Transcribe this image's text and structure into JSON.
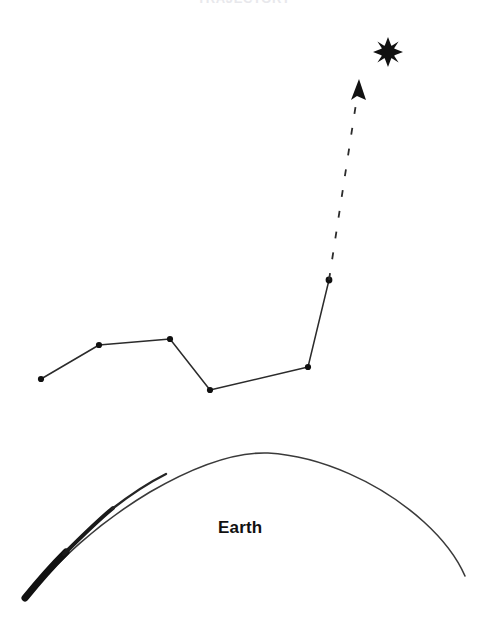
{
  "figure": {
    "title": "TRAJECTORY",
    "background_color": "#ffffff",
    "ink_color": "#1a1a1a"
  },
  "labels": {
    "earth": "Earth"
  },
  "chart_data": {
    "type": "line",
    "title": "TRAJECTORY",
    "xlabel": "",
    "ylabel": "",
    "xlim": [
      0,
      488
    ],
    "ylim": [
      636,
      0
    ],
    "grid": false,
    "legend": "none",
    "annotations": [
      {
        "name": "earth-label",
        "text": "Earth",
        "x": 255,
        "y": 531
      },
      {
        "name": "star-marker",
        "text": "",
        "x": 388,
        "y": 52
      },
      {
        "name": "arrow-tip",
        "text": "",
        "x": 359,
        "y": 82
      }
    ],
    "series": [
      {
        "name": "track-polyline",
        "style": "solid-with-markers",
        "marker": "dot",
        "points": [
          {
            "x": 41,
            "y": 379
          },
          {
            "x": 99,
            "y": 345
          },
          {
            "x": 170,
            "y": 339
          },
          {
            "x": 210,
            "y": 390
          },
          {
            "x": 308,
            "y": 367
          },
          {
            "x": 329,
            "y": 280
          }
        ]
      },
      {
        "name": "projected-path",
        "style": "dashed-arrow",
        "marker": "none",
        "points": [
          {
            "x": 329,
            "y": 280
          },
          {
            "x": 359,
            "y": 84
          }
        ]
      },
      {
        "name": "earth-horizon",
        "style": "tapered-arc",
        "marker": "none",
        "points": [
          {
            "x": 25,
            "y": 598
          },
          {
            "x": 70,
            "y": 556
          },
          {
            "x": 120,
            "y": 514
          },
          {
            "x": 180,
            "y": 479
          },
          {
            "x": 265,
            "y": 453
          },
          {
            "x": 340,
            "y": 460
          },
          {
            "x": 410,
            "y": 497
          },
          {
            "x": 448,
            "y": 540
          },
          {
            "x": 465,
            "y": 576
          }
        ]
      }
    ]
  }
}
